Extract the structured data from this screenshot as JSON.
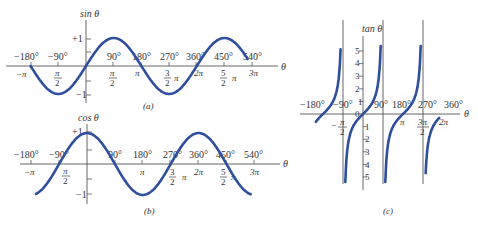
{
  "figure": {
    "panels": [
      {
        "id": "a",
        "caption": "(a)",
        "function": "sin",
        "ylabel": "sin θ",
        "xlabel": "θ",
        "y_ticks": [
          "+1",
          "−1"
        ],
        "degree_ticks": [
          "−180°",
          "−90°",
          "90°",
          "180°",
          "270°",
          "360°",
          "450°",
          "540°"
        ],
        "radian_ticks": [
          "−π",
          "π/2",
          "π/2",
          "π",
          "3/2 π",
          "2π",
          "5/2 π",
          "3π"
        ]
      },
      {
        "id": "b",
        "caption": "(b)",
        "function": "cos",
        "ylabel": "cos θ",
        "xlabel": "θ",
        "y_ticks": [
          "+1",
          "−1"
        ],
        "degree_ticks": [
          "−180°",
          "−90°",
          "90°",
          "180°",
          "270°",
          "360°",
          "450°",
          "540°"
        ],
        "radian_ticks": [
          "−π",
          "π/2",
          "π",
          "3/2 π",
          "2π",
          "5/2 π",
          "3π"
        ]
      },
      {
        "id": "c",
        "caption": "(c)",
        "function": "tan",
        "ylabel": "tan θ",
        "xlabel": "θ",
        "y_ticks": [
          "5",
          "4",
          "3",
          "2",
          "1",
          "0",
          "1",
          "2",
          "3",
          "4",
          "5"
        ],
        "degree_ticks": [
          "−180°",
          "−90°",
          "90°",
          "180°",
          "270°",
          "360°"
        ],
        "radian_ticks": [
          "−π/2",
          "π",
          "3π/2",
          "2π"
        ]
      }
    ],
    "labels": {
      "a": {
        "ylabel": "sin θ",
        "theta": "θ",
        "caption": "(a)",
        "p1": "+1",
        "m1": "−1",
        "d_m180": "−180°",
        "d_m90": "−90°",
        "d_90": "90°",
        "d_180": "180°",
        "d_270": "270°",
        "d_360": "360°",
        "d_450": "450°",
        "d_540": "540°",
        "r_mpi": "−π",
        "r_pi": "π",
        "r_2pi": "2π",
        "r_3pi": "3π",
        "pi_sym": "π",
        "two": "2",
        "three": "3",
        "five": "5"
      },
      "b": {
        "ylabel": "cos θ",
        "theta": "θ",
        "caption": "(b)",
        "p1": "+1",
        "m1": "−1",
        "d_m180": "−180°",
        "d_m90": "−90°",
        "d_90": "90°",
        "d_180": "180°",
        "d_270": "270°",
        "d_360": "360°",
        "d_450": "450°",
        "d_540": "540°",
        "r_mpi": "−π",
        "r_pi": "π",
        "r_2pi": "2π",
        "r_3pi": "3π",
        "pi_sym": "π",
        "two": "2",
        "three": "3",
        "five": "5"
      },
      "c": {
        "ylabel": "tan θ",
        "theta": "θ",
        "caption": "(c)",
        "d_m180": "−180°",
        "d_m90": "−90°",
        "d_90": "90°",
        "d_180": "180°",
        "d_270": "270°",
        "d_360": "360°",
        "r_pi": "π",
        "r_3pi": "3π",
        "r_2pi": "2π",
        "minus": "−",
        "pi_sym": "π",
        "two": "2",
        "y5": "5",
        "y4": "4",
        "y3": "3",
        "y2": "2",
        "y1": "1",
        "y0": "0",
        "n1": "1",
        "n2": "2",
        "n3": "3",
        "n4": "4",
        "n5": "5"
      }
    },
    "colors": {
      "curve": "#2e4f9e",
      "axis": "#555555",
      "text": "#333333"
    }
  }
}
